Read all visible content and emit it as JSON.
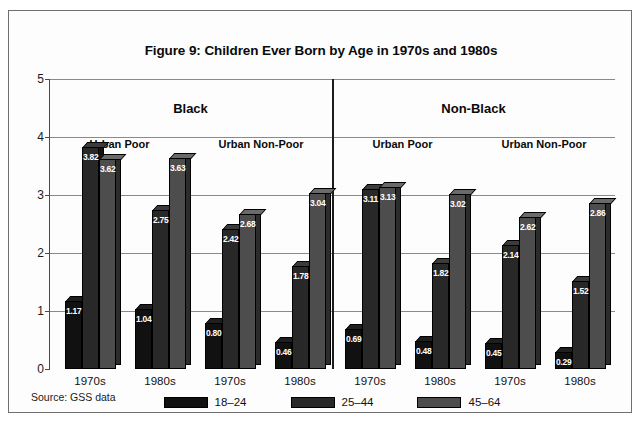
{
  "figure": {
    "title": "Figure 9:  Children Ever Born by Age in 1970s and 1980s",
    "source_note": "Source:  GSS data"
  },
  "panels": [
    {
      "name": "Black"
    },
    {
      "name": "Non-Black"
    }
  ],
  "subgroups": [
    {
      "name": "Urban Poor"
    },
    {
      "name": "Urban Non-Poor"
    },
    {
      "name": "Urban Poor"
    },
    {
      "name": "Urban Non-Poor"
    }
  ],
  "legend": {
    "items": [
      {
        "label": "18–24",
        "color": "#111111"
      },
      {
        "label": "25–44",
        "color": "#282828"
      },
      {
        "label": "45–64",
        "color": "#4d4d4d"
      }
    ]
  },
  "axis": {
    "y_ticks": [
      "0",
      "1",
      "2",
      "3",
      "4",
      "5"
    ],
    "x_labels": [
      "1970s",
      "1980s",
      "1970s",
      "1980s",
      "1970s",
      "1980s",
      "1970s",
      "1980s"
    ]
  },
  "chart_data": {
    "type": "bar",
    "title": "Figure 9:  Children Ever Born by Age in 1970s and 1980s",
    "xlabel": "",
    "ylabel": "",
    "ylim": [
      0,
      5
    ],
    "yticks": [
      0,
      1,
      2,
      3,
      4,
      5
    ],
    "grid": true,
    "legend_position": "bottom",
    "categories": [
      "Black / Urban Poor / 1970s",
      "Black / Urban Poor / 1980s",
      "Black / Urban Non-Poor / 1970s",
      "Black / Urban Non-Poor / 1980s",
      "Non-Black / Urban Poor / 1970s",
      "Non-Black / Urban Poor / 1980s",
      "Non-Black / Urban Non-Poor / 1970s",
      "Non-Black / Urban Non-Poor / 1980s"
    ],
    "series": [
      {
        "name": "18–24",
        "values": [
          1.17,
          1.04,
          0.8,
          0.46,
          0.69,
          0.48,
          0.45,
          0.29
        ]
      },
      {
        "name": "25–44",
        "values": [
          3.82,
          2.75,
          2.42,
          1.78,
          3.11,
          1.82,
          2.14,
          1.52
        ]
      },
      {
        "name": "45–64",
        "values": [
          3.62,
          3.63,
          2.68,
          3.04,
          3.13,
          3.02,
          2.62,
          2.86
        ]
      }
    ],
    "bar_labels": [
      [
        "1.17",
        "1.04",
        "0.80",
        "0.46",
        "0.69",
        "0.48",
        "0.45",
        "0.29"
      ],
      [
        "3.82",
        "2.75",
        "2.42",
        "1.78",
        "3.11",
        "1.82",
        "2.14",
        "1.52"
      ],
      [
        "3.62",
        "3.63",
        "2.68",
        "3.04",
        "3.13",
        "3.02",
        "2.62",
        "2.86"
      ]
    ],
    "source": "Source:  GSS data"
  }
}
